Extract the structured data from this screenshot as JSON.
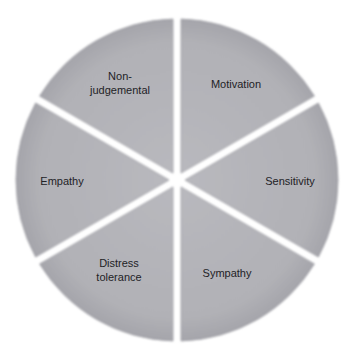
{
  "diagram": {
    "type": "segmented-wheel",
    "segment_count": 6,
    "colors": {
      "segment_fill": "#b3b3b8",
      "segment_edge": "#9c9ca2",
      "gap": "#ffffff",
      "text": "#222226"
    },
    "segments": [
      {
        "id": "motivation",
        "label_lines": [
          "Motivation"
        ]
      },
      {
        "id": "sensitivity",
        "label_lines": [
          "Sensitivity"
        ]
      },
      {
        "id": "sympathy",
        "label_lines": [
          "Sympathy"
        ]
      },
      {
        "id": "distress-tolerance",
        "label_lines": [
          "Distress",
          "tolerance"
        ]
      },
      {
        "id": "empathy",
        "label_lines": [
          "Empathy"
        ]
      },
      {
        "id": "non-judgemental",
        "label_lines": [
          "Non-",
          "judgemental"
        ]
      }
    ]
  }
}
